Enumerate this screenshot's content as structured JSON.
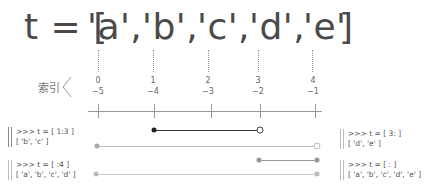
{
  "title": {
    "prefix": "t = [",
    "items": [
      "'a',",
      "'b',",
      "'c',",
      "'d',",
      "'e'"
    ],
    "suffix": "]"
  },
  "index_label": "索引",
  "indices": [
    {
      "pos": "0",
      "neg": "−5",
      "x": 98
    },
    {
      "pos": "1",
      "neg": "−4",
      "x": 154
    },
    {
      "pos": "2",
      "neg": "−3",
      "x": 210
    },
    {
      "pos": "3",
      "neg": "−2",
      "x": 260
    },
    {
      "pos": "4",
      "neg": "−1",
      "x": 315
    }
  ],
  "slices": [
    {
      "code": ">>> t = [ 1:3 ]",
      "result": "[ 'b', 'c' ]",
      "side": "left",
      "color": "#333333"
    },
    {
      "code": ">>> t = [ 3: ]",
      "result": "[ 'd', 'e' ]",
      "side": "right",
      "color": "#bbbbbb"
    },
    {
      "code": ">>> t = [ :4 ]",
      "result": "[ 'a', 'b', 'c', 'd' ]",
      "side": "left",
      "color": "#999999"
    },
    {
      "code": ">>> t = [ : ]",
      "result": "[ 'a', 'b', 'c', 'd', 'e' ]",
      "side": "right",
      "color": "#cccccc"
    }
  ]
}
